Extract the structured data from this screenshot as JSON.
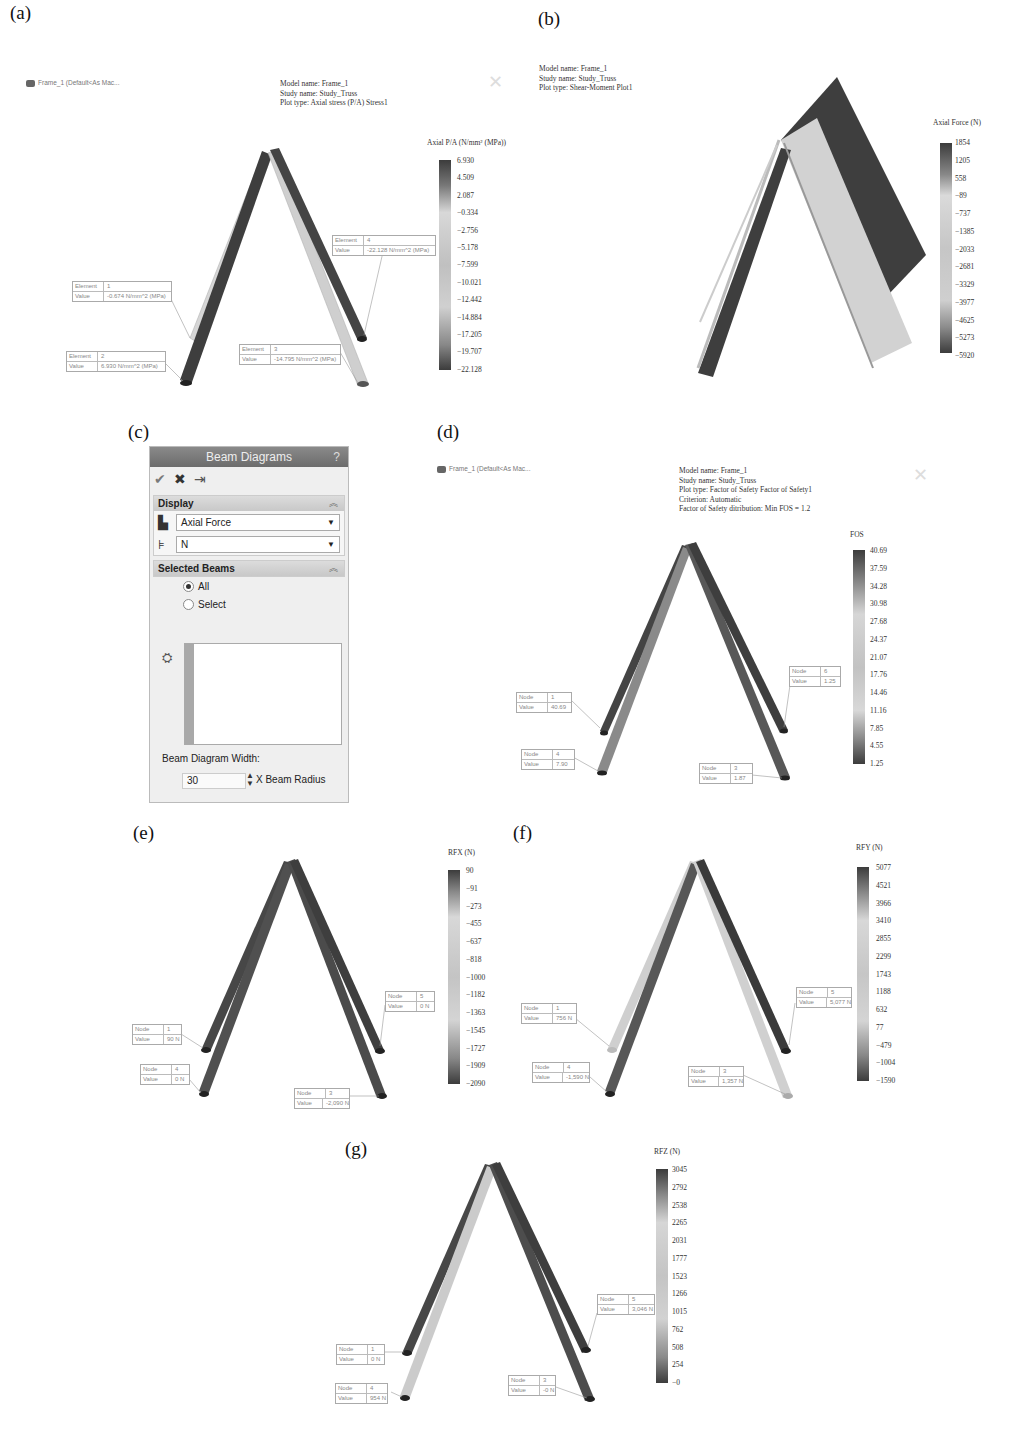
{
  "figure": {
    "panels": {
      "a": {
        "label": "(a)",
        "tree_item": "Frame_1 (Default<As Mac...",
        "info": [
          "Model name: Frame_1",
          "Study name: Study_Truss",
          "Plot type: Axial stress (P/A) Stress1"
        ],
        "legend_title": "Axial P/A (N/mm² (MPa))",
        "legend_ticks": [
          "6.930",
          "4.509",
          "2.087",
          "−0.334",
          "−2.756",
          "−5.178",
          "−7.599",
          "−10.021",
          "−12.442",
          "−14.884",
          "−17.205",
          "−19.707",
          "−22.128"
        ],
        "callouts": [
          {
            "key1": "Element",
            "val1": "1",
            "key2": "Value",
            "val2": "-0.674   N/mm^2 (MPa)"
          },
          {
            "key1": "Element",
            "val1": "2",
            "key2": "Value",
            "val2": "6.930    N/mm^2 (MPa)"
          },
          {
            "key1": "Element",
            "val1": "3",
            "key2": "Value",
            "val2": "-14.795   N/mm^2 (MPa)"
          },
          {
            "key1": "Element",
            "val1": "4",
            "key2": "Value",
            "val2": "-22.128   N/mm^2 (MPa)"
          }
        ]
      },
      "b": {
        "label": "(b)",
        "info": [
          "Model name: Frame_1",
          "Study name: Study_Truss",
          "Plot type: Shear-Moment Plot1"
        ],
        "legend_title": "Axial Force (N)",
        "legend_ticks": [
          "1854",
          "1205",
          "558",
          "−89",
          "−737",
          "−1385",
          "−2033",
          "−2681",
          "−3329",
          "−3977",
          "−4625",
          "−5273",
          "−5920"
        ]
      },
      "c": {
        "label": "(c)",
        "title": "Beam Diagrams",
        "help": "?",
        "actions": {
          "ok": "✔",
          "cancel": "✖",
          "pin": "⇥"
        },
        "display_section": "Display",
        "display_value": "Axial Force",
        "unit_value": "N",
        "selected_section": "Selected Beams",
        "radio_all": "All",
        "radio_select": "Select",
        "width_label": "Beam Diagram Width:",
        "width_value": "30",
        "width_unit": "X Beam Radius"
      },
      "d": {
        "label": "(d)",
        "tree_item": "Frame_1 (Default<As Mac...",
        "info": [
          "Model name: Frame_1",
          "Study name: Study_Truss",
          "Plot type: Factor of Safety Factor of Safety1",
          "Criterion: Automatic",
          "Factor of Safety ditribution: Min FOS = 1.2"
        ],
        "legend_title": "FOS",
        "legend_ticks": [
          "40.69",
          "37.59",
          "34.28",
          "30.98",
          "27.68",
          "24.37",
          "21.07",
          "17.76",
          "14.46",
          "11.16",
          "7.85",
          "4.55",
          "1.25"
        ],
        "callouts": [
          {
            "key1": "Node",
            "val1": "1",
            "key2": "Value",
            "val2": "40.69"
          },
          {
            "key1": "Node",
            "val1": "4",
            "key2": "Value",
            "val2": "7.90"
          },
          {
            "key1": "Node",
            "val1": "3",
            "key2": "Value",
            "val2": "1.87"
          },
          {
            "key1": "Node",
            "val1": "6",
            "key2": "Value",
            "val2": "1.25"
          }
        ]
      },
      "e": {
        "label": "(e)",
        "legend_title": "RFX (N)",
        "legend_ticks": [
          "90",
          "−91",
          "−273",
          "−455",
          "−637",
          "−818",
          "−1000",
          "−1182",
          "−1363",
          "−1545",
          "−1727",
          "−1909",
          "−2090"
        ],
        "callouts": [
          {
            "key1": "Node",
            "val1": "1",
            "key2": "Value",
            "val2": "90   N"
          },
          {
            "key1": "Node",
            "val1": "4",
            "key2": "Value",
            "val2": "0    N"
          },
          {
            "key1": "Node",
            "val1": "3",
            "key2": "Value",
            "val2": "-2,090  N"
          },
          {
            "key1": "Node",
            "val1": "5",
            "key2": "Value",
            "val2": "0    N"
          }
        ]
      },
      "f": {
        "label": "(f)",
        "legend_title": "RFY (N)",
        "legend_ticks": [
          "5077",
          "4521",
          "3966",
          "3410",
          "2855",
          "2299",
          "1743",
          "1188",
          "632",
          "77",
          "−479",
          "−1004",
          "−1590"
        ],
        "callouts": [
          {
            "key1": "Node",
            "val1": "1",
            "key2": "Value",
            "val2": "756   N"
          },
          {
            "key1": "Node",
            "val1": "4",
            "key2": "Value",
            "val2": "-1,590  N"
          },
          {
            "key1": "Node",
            "val1": "3",
            "key2": "Value",
            "val2": "1,357   N"
          },
          {
            "key1": "Node",
            "val1": "5",
            "key2": "Value",
            "val2": "5,077   N"
          }
        ]
      },
      "g": {
        "label": "(g)",
        "legend_title": "RFZ (N)",
        "legend_ticks": [
          "3045",
          "2792",
          "2538",
          "2265",
          "2031",
          "1777",
          "1523",
          "1266",
          "1015",
          "762",
          "508",
          "254",
          "−0"
        ],
        "callouts": [
          {
            "key1": "Node",
            "val1": "1",
            "key2": "Value",
            "val2": "0    N"
          },
          {
            "key1": "Node",
            "val1": "4",
            "key2": "Value",
            "val2": "954   N"
          },
          {
            "key1": "Node",
            "val1": "3",
            "key2": "Value",
            "val2": "-0   N"
          },
          {
            "key1": "Node",
            "val1": "5",
            "key2": "Value",
            "val2": "3,046   N"
          }
        ]
      }
    }
  },
  "colors": {
    "beam_dark": "#3a3a3a",
    "beam_mid": "#6e6e6e",
    "beam_light": "#d4d4d4",
    "legend_top": "#3d3d3d",
    "legend_mid": "#dadada",
    "legend_bottom": "#3d3d3d",
    "panel_title_bg": "#777777"
  }
}
